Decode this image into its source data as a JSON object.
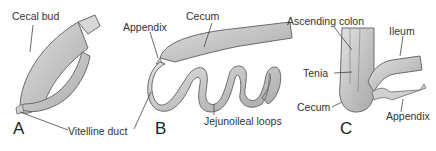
{
  "figure": {
    "panels": [
      {
        "letter": "A",
        "labels": {
          "cecal_bud": "Cecal bud",
          "vitelline_duct": "Vitelline duct"
        }
      },
      {
        "letter": "B",
        "labels": {
          "appendix": "Appendix",
          "cecum": "Cecum",
          "jejunoileal_loops": "Jejunoileal loops"
        }
      },
      {
        "letter": "C",
        "labels": {
          "ascending_colon": "Ascending colon",
          "ileum": "Ileum",
          "tenia": "Tenia",
          "cecum": "Cecum",
          "appendix": "Appendix"
        }
      }
    ]
  },
  "colors": {
    "tissue_fill": "#c9c9c9",
    "tissue_stroke": "#6a6a6a",
    "leader_line": "#444444",
    "text": "#333333"
  }
}
